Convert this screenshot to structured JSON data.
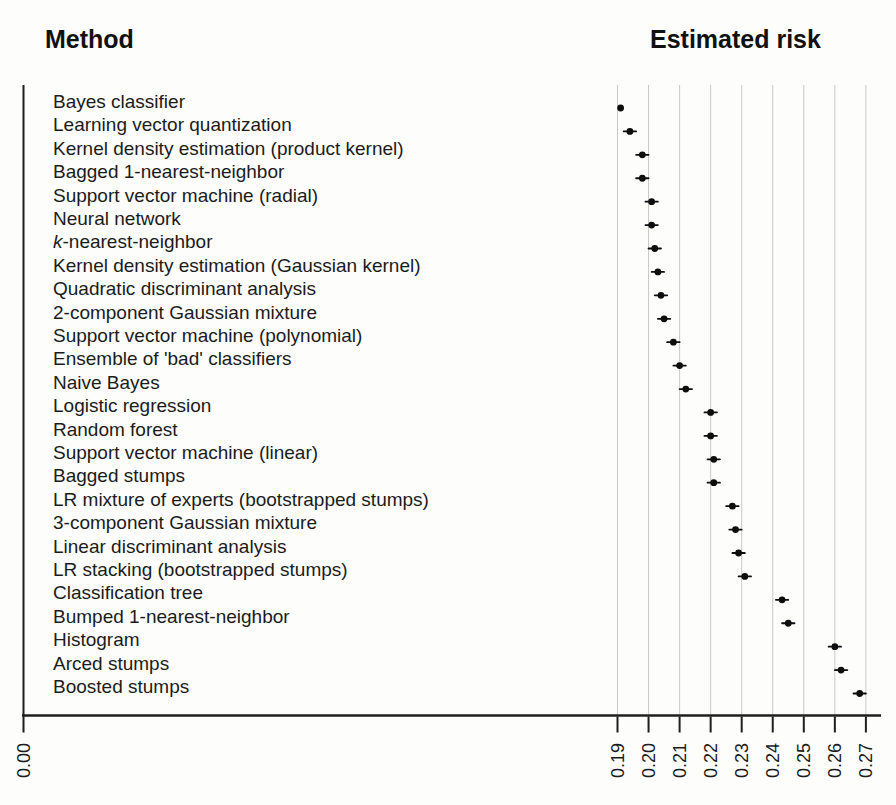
{
  "chart_data": {
    "type": "scatter",
    "subtype": "horizontal-dot-plot-with-error-bars",
    "left_title": "Method",
    "right_title": "Estimated risk",
    "x_axis": {
      "origin_label": "0.00",
      "tick_labels": [
        "0.19",
        "0.20",
        "0.21",
        "0.22",
        "0.23",
        "0.24",
        "0.25",
        "0.26",
        "0.27"
      ],
      "range_shown": [
        0.19,
        0.27
      ],
      "broken_axis": true,
      "grid": "vertical-light-gray"
    },
    "legend": "none",
    "points": [
      {
        "method": "Bayes classifier",
        "risk": 0.191,
        "bar": 0
      },
      {
        "method": "Learning vector quantization",
        "risk": 0.194,
        "bar": 0.002
      },
      {
        "method": "Kernel density estimation (product kernel)",
        "risk": 0.198,
        "bar": 0.002
      },
      {
        "method": "Bagged 1-nearest-neighbor",
        "risk": 0.198,
        "bar": 0.002
      },
      {
        "method": "Support vector machine (radial)",
        "risk": 0.201,
        "bar": 0.002
      },
      {
        "method": "Neural network",
        "risk": 0.201,
        "bar": 0.002
      },
      {
        "method": "k-nearest-neighbor",
        "risk": 0.202,
        "bar": 0.002,
        "italic_prefix": "k"
      },
      {
        "method": "Kernel density estimation (Gaussian kernel)",
        "risk": 0.203,
        "bar": 0.002
      },
      {
        "method": "Quadratic discriminant analysis",
        "risk": 0.204,
        "bar": 0.002
      },
      {
        "method": "2-component Gaussian mixture",
        "risk": 0.205,
        "bar": 0.002
      },
      {
        "method": "Support vector machine (polynomial)",
        "risk": 0.208,
        "bar": 0.002
      },
      {
        "method": "Ensemble of 'bad' classifiers",
        "risk": 0.21,
        "bar": 0.002
      },
      {
        "method": "Naive Bayes",
        "risk": 0.212,
        "bar": 0.002
      },
      {
        "method": "Logistic regression",
        "risk": 0.22,
        "bar": 0.002
      },
      {
        "method": "Random forest",
        "risk": 0.22,
        "bar": 0.002
      },
      {
        "method": "Support vector machine (linear)",
        "risk": 0.221,
        "bar": 0.002
      },
      {
        "method": "Bagged stumps",
        "risk": 0.221,
        "bar": 0.002
      },
      {
        "method": "LR mixture of experts (bootstrapped stumps)",
        "risk": 0.227,
        "bar": 0.002
      },
      {
        "method": "3-component Gaussian mixture",
        "risk": 0.228,
        "bar": 0.002
      },
      {
        "method": "Linear discriminant analysis",
        "risk": 0.229,
        "bar": 0.002
      },
      {
        "method": "LR stacking (bootstrapped stumps)",
        "risk": 0.231,
        "bar": 0.002
      },
      {
        "method": "Classification tree",
        "risk": 0.243,
        "bar": 0.002
      },
      {
        "method": "Bumped 1-nearest-neighbor",
        "risk": 0.245,
        "bar": 0.002
      },
      {
        "method": "Histogram",
        "risk": 0.26,
        "bar": 0.002
      },
      {
        "method": "Arced stumps",
        "risk": 0.262,
        "bar": 0.002
      },
      {
        "method": "Boosted stumps",
        "risk": 0.268,
        "bar": 0.002
      }
    ],
    "colors": {
      "point": "#0d0d0d",
      "axis": "#1f1f1f",
      "gridline": "#c9c9c9",
      "text": "#1b1b1b"
    }
  }
}
